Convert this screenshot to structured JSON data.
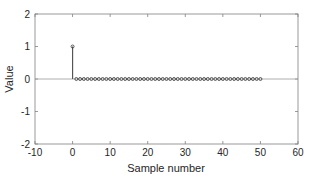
{
  "chart_data": {
    "type": "stem",
    "title": "",
    "xlabel": "Sample number",
    "ylabel": "Value",
    "xlim": [
      -10,
      60
    ],
    "ylim": [
      -2,
      2
    ],
    "xticks": [
      -10,
      0,
      10,
      20,
      30,
      40,
      50,
      60
    ],
    "yticks": [
      -2,
      -1,
      0,
      1,
      2
    ],
    "grid": false,
    "legend": null,
    "x": [
      0,
      1,
      2,
      3,
      4,
      5,
      6,
      7,
      8,
      9,
      10,
      11,
      12,
      13,
      14,
      15,
      16,
      17,
      18,
      19,
      20,
      21,
      22,
      23,
      24,
      25,
      26,
      27,
      28,
      29,
      30,
      31,
      32,
      33,
      34,
      35,
      36,
      37,
      38,
      39,
      40,
      41,
      42,
      43,
      44,
      45,
      46,
      47,
      48,
      49,
      50
    ],
    "values": [
      1,
      0,
      0,
      0,
      0,
      0,
      0,
      0,
      0,
      0,
      0,
      0,
      0,
      0,
      0,
      0,
      0,
      0,
      0,
      0,
      0,
      0,
      0,
      0,
      0,
      0,
      0,
      0,
      0,
      0,
      0,
      0,
      0,
      0,
      0,
      0,
      0,
      0,
      0,
      0,
      0,
      0,
      0,
      0,
      0,
      0,
      0,
      0,
      0,
      0,
      0
    ],
    "colors": {
      "stem": "#555555",
      "marker": "#333333",
      "axes": "#808080",
      "baseline": "#999999"
    }
  }
}
